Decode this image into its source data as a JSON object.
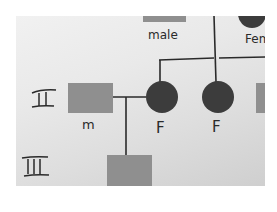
{
  "figure": {
    "kind": "hand-drawn pedigree chart (photo)",
    "colors": {
      "paper": "#e6e6e6",
      "male_fill": "#8f8f8f",
      "female_fill": "#3c3c3c",
      "ink": "#2a2a2a"
    }
  },
  "legend": {
    "male_label": "male",
    "female_label": "Fem"
  },
  "generations": [
    {
      "numeral": "II",
      "members": [
        {
          "sex": "male",
          "label": "m",
          "affected": false
        },
        {
          "sex": "female",
          "label": "F",
          "affected": true
        },
        {
          "sex": "female",
          "label": "F",
          "affected": true
        }
      ]
    },
    {
      "numeral": "III",
      "members": [
        {
          "sex": "male",
          "label": "",
          "affected": false
        }
      ]
    }
  ]
}
